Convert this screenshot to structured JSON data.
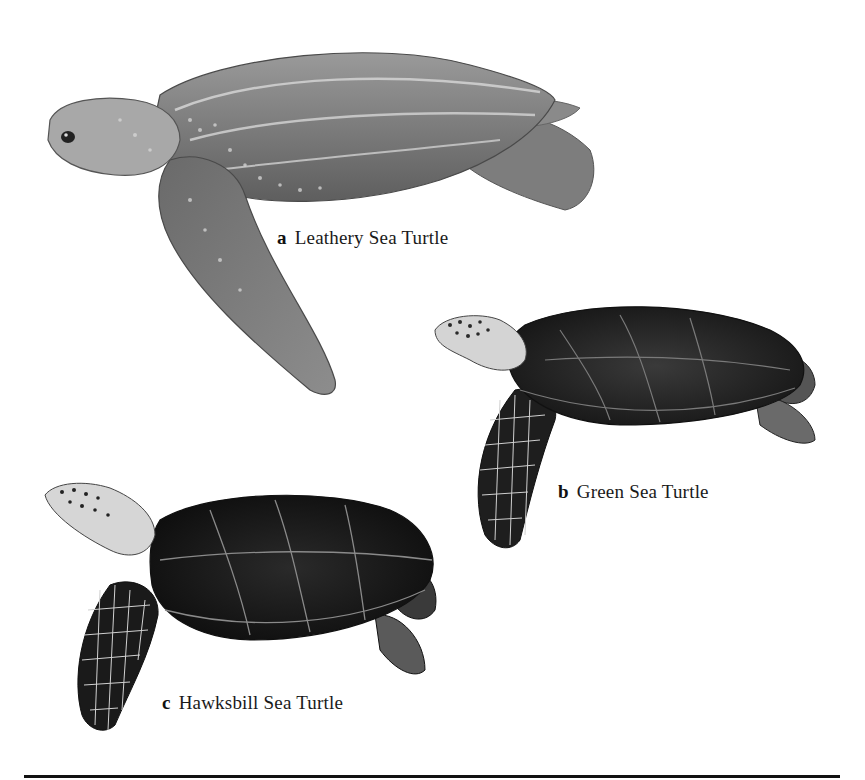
{
  "figure": {
    "turtles": [
      {
        "letter": "a",
        "name": "Leathery Sea Turtle"
      },
      {
        "letter": "b",
        "name": "Green Sea Turtle"
      },
      {
        "letter": "c",
        "name": "Hawksbill Sea Turtle"
      }
    ]
  }
}
